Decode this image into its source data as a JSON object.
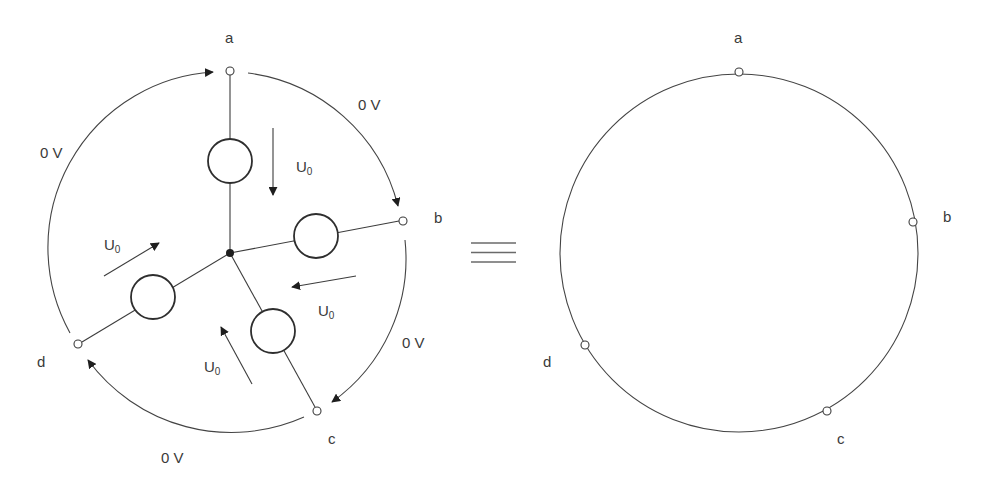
{
  "left_diagram": {
    "node_labels": {
      "a": "a",
      "b": "b",
      "c": "c",
      "d": "d"
    },
    "source_voltage_label": {
      "main": "U",
      "sub": "0"
    },
    "arc_voltage_label": "0 V",
    "sources": [
      {
        "name": "source-a",
        "label_main": "U",
        "label_sub": "0"
      },
      {
        "name": "source-b",
        "label_main": "U",
        "label_sub": "0"
      },
      {
        "name": "source-c",
        "label_main": "U",
        "label_sub": "0"
      },
      {
        "name": "source-d",
        "label_main": "U",
        "label_sub": "0"
      }
    ],
    "arcs": [
      {
        "from": "a",
        "to": "b",
        "label": "0 V"
      },
      {
        "from": "b",
        "to": "c",
        "label": "0 V"
      },
      {
        "from": "c",
        "to": "d",
        "label": "0 V"
      },
      {
        "from": "d",
        "to": "a",
        "label": "0 V"
      }
    ]
  },
  "equivalence_symbol": "≡",
  "right_diagram": {
    "node_labels": {
      "a": "a",
      "b": "b",
      "c": "c",
      "d": "d"
    }
  }
}
